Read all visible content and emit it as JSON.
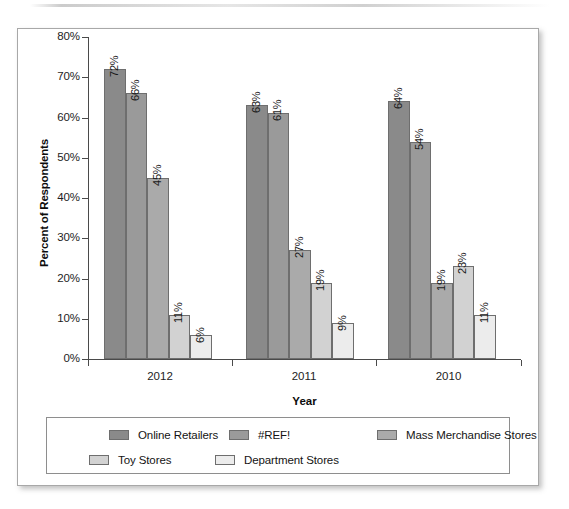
{
  "chart_data": {
    "type": "bar",
    "title": "",
    "xlabel": "Year",
    "ylabel": "Percent of Respondents",
    "categories": [
      "2012",
      "2011",
      "2010"
    ],
    "series": [
      {
        "name": "Online Retailers",
        "values": [
          72,
          66,
          64
        ],
        "color": "#8a8a8a"
      },
      {
        "name": "#REF!",
        "values": [
          66,
          61,
          54
        ],
        "color": "#9a9a9a"
      },
      {
        "name": "Mass Merchandise Stores",
        "values": [
          45,
          27,
          19
        ],
        "color": "#aaaaaa"
      },
      {
        "name": "Toy Stores",
        "values": [
          11,
          19,
          23
        ],
        "color": "#d2d2d2"
      },
      {
        "name": "Department Stores",
        "values": [
          6,
          9,
          11
        ],
        "color": "#ececec"
      }
    ],
    "value_labels": [
      [
        "72%",
        "66%",
        "45%",
        "11%",
        "6%"
      ],
      [
        "63%",
        "61%",
        "27%",
        "19%",
        "9%"
      ],
      [
        "64%",
        "54%",
        "19%",
        "23%",
        "11%"
      ]
    ],
    "group_label_note": "2011 first bar is drawn at 63% though Online Retailers series value shown is 63%",
    "ylim": [
      0,
      80
    ],
    "ytick_labels": [
      "0%",
      "10%",
      "20%",
      "30%",
      "40%",
      "50%",
      "60%",
      "70%",
      "80%"
    ],
    "ytick_values": [
      0,
      10,
      20,
      30,
      40,
      50,
      60,
      70,
      80
    ],
    "grid": false,
    "legend_position": "bottom",
    "legend_entries": [
      "Online Retailers",
      "#REF!",
      "Mass Merchandise Stores",
      "Toy Stores",
      "Department Stores"
    ]
  },
  "bars": [
    {
      "group": "2012",
      "series": "Online Retailers",
      "value": 72,
      "label": "72%"
    },
    {
      "group": "2012",
      "series": "#REF!",
      "value": 66,
      "label": "66%"
    },
    {
      "group": "2012",
      "series": "Mass Merchandise Stores",
      "value": 45,
      "label": "45%"
    },
    {
      "group": "2012",
      "series": "Toy Stores",
      "value": 11,
      "label": "11%"
    },
    {
      "group": "2012",
      "series": "Department Stores",
      "value": 6,
      "label": "6%"
    },
    {
      "group": "2011",
      "series": "Online Retailers",
      "value": 63,
      "label": "63%"
    },
    {
      "group": "2011",
      "series": "#REF!",
      "value": 61,
      "label": "61%"
    },
    {
      "group": "2011",
      "series": "Mass Merchandise Stores",
      "value": 27,
      "label": "27%"
    },
    {
      "group": "2011",
      "series": "Toy Stores",
      "value": 19,
      "label": "19%"
    },
    {
      "group": "2011",
      "series": "Department Stores",
      "value": 9,
      "label": "9%"
    },
    {
      "group": "2010",
      "series": "Online Retailers",
      "value": 64,
      "label": "64%"
    },
    {
      "group": "2010",
      "series": "#REF!",
      "value": 54,
      "label": "54%"
    },
    {
      "group": "2010",
      "series": "Mass Merchandise Stores",
      "value": 19,
      "label": "19%"
    },
    {
      "group": "2010",
      "series": "Toy Stores",
      "value": 23,
      "label": "23%"
    },
    {
      "group": "2010",
      "series": "Department Stores",
      "value": 11,
      "label": "11%"
    }
  ],
  "colors": {
    "series_1": "#8a8a8a",
    "series_2": "#9a9a9a",
    "series_3": "#aaaaaa",
    "series_4": "#d2d2d2",
    "series_5": "#ececec",
    "axis": "#4a4a4a",
    "text": "#1a1a1a",
    "card_border": "#a8a8a8",
    "legend_border": "#8e8e8e"
  }
}
